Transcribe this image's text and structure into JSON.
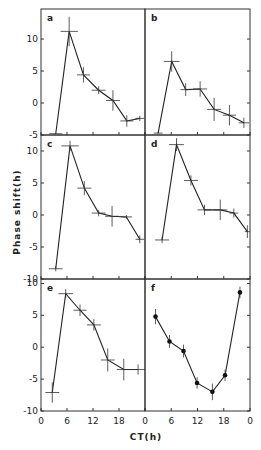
{
  "chart_data": {
    "type": "line",
    "xlabel": "CT(h)",
    "ylabel": "Phase shift(h)",
    "x_tick_labels": [
      "0",
      "6",
      "12",
      "18",
      "0"
    ],
    "x_ticks": [
      0,
      6,
      12,
      18,
      24
    ],
    "xlim": [
      0,
      24
    ],
    "grid": false,
    "panels": [
      {
        "label": "a",
        "marker": "cross",
        "ylim": [
          -5,
          14.7
        ],
        "y_ticks": [
          -5,
          0,
          5,
          10
        ],
        "y_tick_labels": [
          "-5",
          "0",
          "5",
          "10"
        ],
        "x": [
          3.4,
          6.5,
          9.8,
          13.3,
          16.6,
          19.8,
          22.8
        ],
        "y": [
          -4.8,
          11.2,
          4.4,
          2.0,
          0.4,
          -2.8,
          -2.4
        ],
        "yerr": [
          0.1,
          2.3,
          1.2,
          0.6,
          1.6,
          0.9,
          0.4
        ],
        "xerr": [
          1.5,
          2.0,
          1.5,
          1.6,
          1.6,
          1.5,
          1.0
        ]
      },
      {
        "label": "b",
        "marker": "cross",
        "ylim": [
          -5,
          14.7
        ],
        "x": [
          3.0,
          6.1,
          9.3,
          12.6,
          15.8,
          19.3,
          22.6
        ],
        "y": [
          -4.7,
          6.5,
          2.1,
          2.2,
          -1.0,
          -1.9,
          -3.1
        ],
        "yerr": [
          0.1,
          1.6,
          1.0,
          1.2,
          1.8,
          1.6,
          0.8
        ],
        "xerr": [
          1.0,
          1.8,
          1.2,
          1.6,
          1.6,
          1.5,
          1.2
        ]
      },
      {
        "label": "c",
        "marker": "cross",
        "ylim": [
          -10,
          12.5
        ],
        "y_ticks": [
          -10,
          -5,
          0,
          5,
          10
        ],
        "y_tick_labels": [
          "-10",
          "-5",
          "0",
          "5",
          "10"
        ],
        "x": [
          3.4,
          6.7,
          10.0,
          13.3,
          16.4,
          19.7,
          22.8
        ],
        "y": [
          -8.4,
          10.8,
          4.2,
          0.3,
          -0.2,
          -0.3,
          -3.8
        ],
        "yerr": [
          0.4,
          0.8,
          1.1,
          0.5,
          1.6,
          0.3,
          0.6
        ],
        "xerr": [
          1.6,
          2.0,
          1.6,
          1.6,
          1.6,
          1.3,
          1.0
        ]
      },
      {
        "label": "d",
        "marker": "cross",
        "ylim": [
          -10,
          12.5
        ],
        "x": [
          3.9,
          7.2,
          10.5,
          13.6,
          17.2,
          20.3,
          23.4
        ],
        "y": [
          -3.9,
          11.0,
          5.4,
          0.8,
          0.8,
          0.3,
          -2.6
        ],
        "yerr": [
          0.5,
          1.0,
          0.8,
          0.8,
          1.6,
          0.7,
          1.0
        ],
        "xerr": [
          1.6,
          1.7,
          1.6,
          1.6,
          1.6,
          1.0,
          0.6
        ]
      },
      {
        "label": "e",
        "marker": "cross",
        "ylim": [
          -10,
          10.7
        ],
        "y_ticks": [
          -10,
          -5,
          0,
          5,
          10
        ],
        "y_tick_labels": [
          "-10",
          "-5",
          "0",
          "5",
          "10"
        ],
        "x": [
          2.6,
          5.7,
          9.0,
          12.2,
          15.4,
          19.1,
          22.4
        ],
        "y": [
          -7.1,
          8.4,
          5.8,
          3.5,
          -2.0,
          -3.5,
          -3.5
        ],
        "yerr": [
          1.6,
          0.7,
          0.9,
          0.9,
          1.8,
          1.7,
          0.8
        ],
        "xerr": [
          1.6,
          1.7,
          1.5,
          1.6,
          1.6,
          1.6,
          1.6
        ]
      },
      {
        "label": "f",
        "marker": "dot",
        "ylim": [
          -10,
          10.7
        ],
        "x": [
          2.4,
          5.6,
          8.8,
          11.9,
          15.4,
          18.3,
          21.7
        ],
        "y": [
          4.8,
          0.9,
          -0.6,
          -5.6,
          -7.0,
          -4.4,
          8.6
        ],
        "yerr": [
          1.2,
          1.0,
          1.0,
          0.9,
          1.3,
          0.9,
          0.9
        ],
        "xerr": [
          0,
          0,
          0,
          0,
          0,
          0,
          0
        ]
      }
    ]
  }
}
